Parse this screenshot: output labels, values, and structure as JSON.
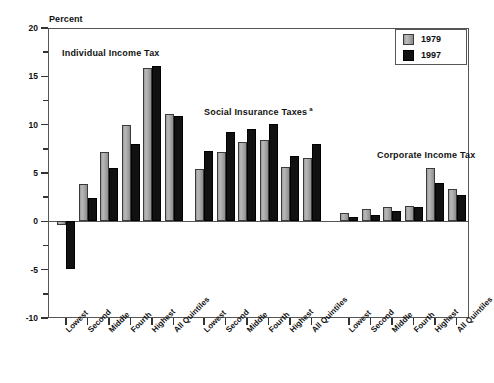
{
  "chart_data": {
    "type": "bar",
    "title": "",
    "ylabel": "Percent",
    "xlabel": "",
    "ylim": [
      -10,
      20
    ],
    "yticks": [
      20,
      15,
      10,
      5,
      0,
      -5,
      -10
    ],
    "ytick_labels": [
      "20",
      "15",
      "10",
      "5",
      "0",
      "-5",
      "-10"
    ],
    "grid": false,
    "legend_position": "top-right",
    "legend": [
      "1979",
      "1997"
    ],
    "categories": [
      "Lowest",
      "Second",
      "Middle",
      "Fourth",
      "Highest",
      "All Quintiles"
    ],
    "panels": [
      {
        "name": "Individual Income Tax",
        "footnote": "",
        "series": [
          {
            "name": "1979",
            "values": [
              -0.4,
              3.9,
              7.2,
              10.0,
              15.9,
              11.1
            ]
          },
          {
            "name": "1997",
            "values": [
              -4.9,
              2.4,
              5.5,
              8.0,
              16.1,
              10.9
            ]
          }
        ]
      },
      {
        "name": "Social Insurance Taxes",
        "footnote": "a",
        "series": [
          {
            "name": "1979",
            "values": [
              5.4,
              7.2,
              8.2,
              8.4,
              5.6,
              6.6
            ]
          },
          {
            "name": "1997",
            "values": [
              7.3,
              9.2,
              9.6,
              10.1,
              6.8,
              8.0
            ]
          }
        ]
      },
      {
        "name": "Corporate Income Tax",
        "footnote": "",
        "series": [
          {
            "name": "1979",
            "values": [
              0.9,
              1.3,
              1.5,
              1.6,
              5.5,
              3.3
            ]
          },
          {
            "name": "1997",
            "values": [
              0.5,
              0.7,
              1.1,
              1.5,
              4.0,
              2.7
            ]
          }
        ]
      }
    ],
    "colors": {
      "series_1979": "#a8a8a8",
      "series_1997": "#111111",
      "axis": "#555555",
      "text": "#111111",
      "background": "#ffffff"
    }
  }
}
